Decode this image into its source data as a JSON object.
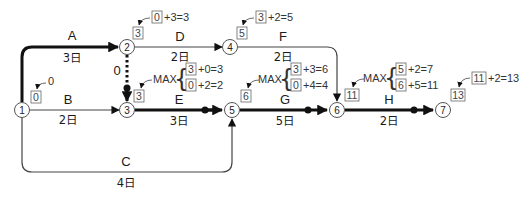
{
  "nodes": [
    {
      "id": "1",
      "x": 22,
      "y": 110
    },
    {
      "id": "2",
      "x": 127,
      "y": 47
    },
    {
      "id": "3",
      "x": 127,
      "y": 110
    },
    {
      "id": "4",
      "x": 230,
      "y": 47
    },
    {
      "id": "5",
      "x": 232,
      "y": 110
    },
    {
      "id": "6",
      "x": 337,
      "y": 110
    },
    {
      "id": "7",
      "x": 443,
      "y": 110
    }
  ],
  "activities": {
    "A": {
      "label": "A",
      "duration": "3日",
      "critical": true
    },
    "B": {
      "label": "B",
      "duration": "2日",
      "critical": false
    },
    "C": {
      "label": "C",
      "duration": "4日",
      "critical": false
    },
    "D": {
      "label": "D",
      "duration": "2日",
      "critical": false
    },
    "E": {
      "label": "E",
      "duration": "3日",
      "critical": true
    },
    "F": {
      "label": "F",
      "duration": "2日",
      "critical": false
    },
    "G": {
      "label": "G",
      "duration": "5日",
      "critical": true
    },
    "H": {
      "label": "H",
      "duration": "2日",
      "critical": true
    },
    "dummy": {
      "label": "0",
      "duration": "",
      "critical": true
    }
  },
  "earliest_times": {
    "n1": {
      "box": "0",
      "calc": "0"
    },
    "n2": {
      "box": "3",
      "calc_box": "0",
      "calc": "+3=3"
    },
    "n3": {
      "box": "3",
      "max_label": "MAX",
      "line1_box": "3",
      "line1": "+0=3",
      "line2_box": "0",
      "line2": "+2=2"
    },
    "n4": {
      "box": "5",
      "calc_box": "3",
      "calc": "+2=5"
    },
    "n5": {
      "box": "6",
      "max_label": "MAX",
      "line1_box": "3",
      "line1": "+3=6",
      "line2_box": "0",
      "line2": "+4=4"
    },
    "n6": {
      "box": "11",
      "max_label": "MAX",
      "line1_box": "5",
      "line1": "+2=7",
      "line2_box": "6",
      "line2": "+5=11"
    },
    "n7": {
      "box": "13",
      "calc_box": "11",
      "calc": "+2=13"
    }
  },
  "colors": {
    "critical": "#111111",
    "normal": "#444444",
    "box_border": "#666666"
  }
}
